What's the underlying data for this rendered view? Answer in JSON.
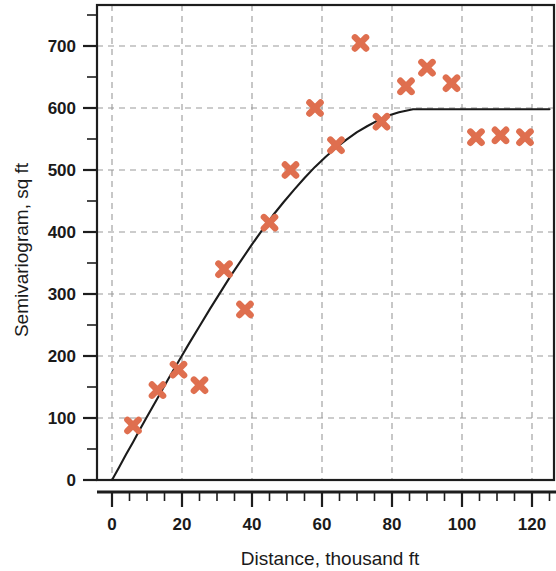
{
  "chart_data": {
    "type": "scatter",
    "title": "",
    "xlabel": "Distance, thousand ft",
    "ylabel": "Semivariogram, sq ft",
    "xlim": [
      0,
      125
    ],
    "ylim": [
      0,
      760
    ],
    "xticks": [
      0,
      20,
      40,
      60,
      80,
      100,
      120
    ],
    "xtick_labels": [
      "0",
      "20",
      "40",
      "60",
      "80",
      "100",
      "120"
    ],
    "x_minor_step": 5,
    "yticks": [
      0,
      100,
      200,
      300,
      400,
      500,
      600,
      700
    ],
    "ytick_labels": [
      "0",
      "100",
      "200",
      "300",
      "400",
      "500",
      "600",
      "700"
    ],
    "y_minor_step": 50,
    "grid": true,
    "grid_style": "dashed",
    "legend": null,
    "marker_symbol": "x",
    "marker_color": "#DF6F4F",
    "curve_color": "#1b1b1b",
    "frame_color": "#1d1d1d",
    "grid_color": "#9a9a9a",
    "background": "#ffffff",
    "series": [
      {
        "name": "Experimental semivariogram",
        "type": "scatter",
        "x": [
          6,
          13,
          19,
          25,
          32,
          38,
          45,
          51,
          58,
          64,
          71,
          77,
          84,
          90,
          97,
          104,
          111,
          118
        ],
        "y": [
          88,
          145,
          178,
          153,
          340,
          275,
          415,
          500,
          600,
          540,
          705,
          578,
          635,
          665,
          640,
          553,
          556,
          553
        ]
      },
      {
        "name": "Fitted model",
        "type": "line",
        "model": "spherical",
        "sill": 598,
        "range": 86,
        "nugget": 0,
        "x": [
          0,
          2,
          4,
          6,
          8,
          10,
          13,
          16,
          19,
          22,
          25,
          28,
          31,
          34,
          37,
          40,
          43,
          46,
          49,
          52,
          55,
          58,
          61,
          64,
          67,
          70,
          73,
          76,
          79,
          82,
          86,
          90,
          95,
          100,
          105,
          110,
          115,
          120,
          125
        ],
        "y": [
          0,
          20,
          41,
          61,
          82,
          102,
          132,
          162,
          191,
          220,
          248,
          276,
          303,
          330,
          355,
          380,
          404,
          427,
          448,
          468,
          487,
          505,
          521,
          536,
          549,
          561,
          571,
          580,
          588,
          593,
          598,
          598,
          598,
          598,
          598,
          598,
          598,
          598,
          598
        ]
      }
    ]
  },
  "axes": {
    "x_title": "Distance, thousand ft",
    "y_title": "Semivariogram, sq ft"
  }
}
